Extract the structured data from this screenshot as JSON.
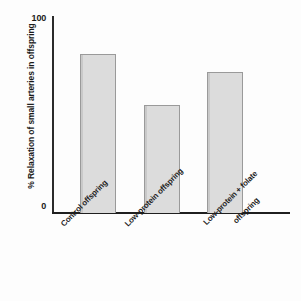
{
  "chart_data": {
    "type": "bar",
    "title": "",
    "xlabel": "",
    "ylabel": "%  Relaxation of small arteries in offspring",
    "categories": [
      "Control offspring",
      "Low-protein offspring",
      "Low-protein + folate offspring"
    ],
    "values": [
      81,
      55,
      72
    ],
    "ylim": [
      0,
      100
    ],
    "ytick_labels": [
      "0",
      "100"
    ],
    "yticks": [
      0,
      100
    ],
    "grid": false,
    "legend": null,
    "bar_color": "#dcdcdc",
    "bar_border_color": "#9a9a9a",
    "axis_color": "#1f1f1f",
    "background_color": "#fdfdfd"
  },
  "axis": {
    "y_tick_top": "100",
    "y_tick_bottom": "0",
    "y_title": "%  Relaxation of small arteries in offspring"
  },
  "categories": {
    "bar1_label": "Control offspring",
    "bar2_label": "Low-protein offspring",
    "bar3_label_line1": "Low-protein + folate",
    "bar3_label_line2": "offspring"
  }
}
